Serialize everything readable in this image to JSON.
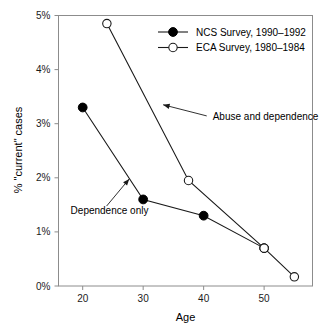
{
  "chart_data": {
    "type": "line",
    "title": "",
    "xlabel": "Age",
    "ylabel": "% \"current\" cases",
    "xlim": [
      16,
      58
    ],
    "ylim": [
      0,
      5
    ],
    "grid": false,
    "legend_position": "top-right",
    "x_ticks": [
      20,
      30,
      40,
      50
    ],
    "x_tick_labels": [
      "20",
      "30",
      "40",
      "50"
    ],
    "y_ticks": [
      0,
      1,
      2,
      3,
      4,
      5
    ],
    "y_tick_labels": [
      "0%",
      "1%",
      "2%",
      "3%",
      "4%",
      "5%"
    ],
    "series": [
      {
        "name": "NCS Survey, 1990–1992",
        "marker": "filled-circle",
        "x": [
          20,
          30,
          40,
          50
        ],
        "values": [
          3.3,
          1.6,
          1.3,
          0.7
        ]
      },
      {
        "name": "ECA Survey, 1980–1984",
        "marker": "open-circle",
        "x": [
          24,
          37.5,
          50,
          55
        ],
        "values": [
          4.85,
          1.95,
          0.7,
          0.17
        ]
      }
    ],
    "annotations": [
      {
        "text": "Abuse and dependence",
        "text_x": 41.5,
        "text_y": 3.07,
        "arrow_tip_x": 33.3,
        "arrow_tip_y": 3.35
      },
      {
        "text": "Dependence only",
        "text_x": 18.0,
        "text_y": 1.33,
        "arrow_tip_x": 27.7,
        "arrow_tip_y": 1.98
      }
    ]
  },
  "legend": {
    "items": [
      {
        "label": "NCS Survey, 1990–1992",
        "marker": "filled-circle"
      },
      {
        "label": "ECA Survey, 1980–1984",
        "marker": "open-circle"
      }
    ]
  },
  "axes": {
    "x_title": "Age",
    "y_title": "% \"current\" cases"
  }
}
